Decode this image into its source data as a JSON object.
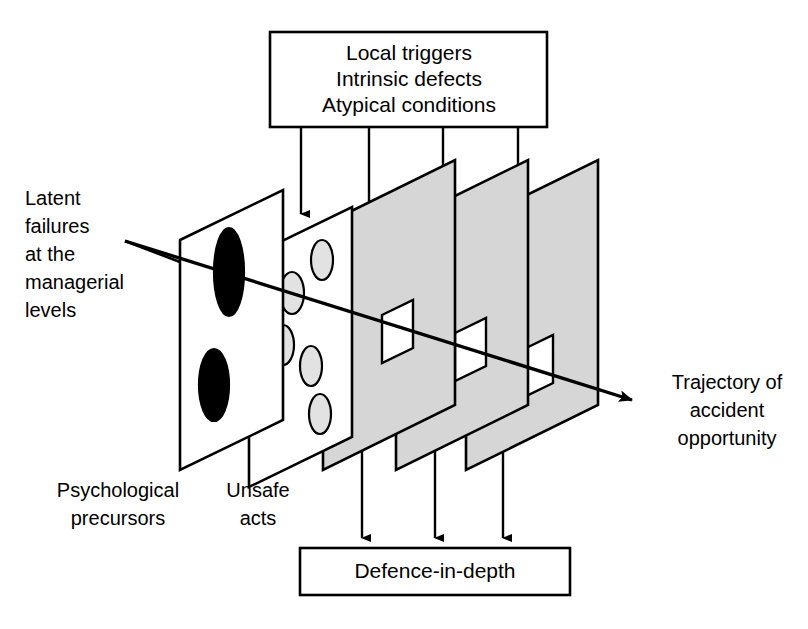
{
  "diagram": {
    "type": "layered-defences-diagram",
    "colors": {
      "stroke": "#000000",
      "background": "#ffffff",
      "plane_gray": "#d6d6d6",
      "hole_dark": "#000000",
      "hole_light": "#e2e2e2",
      "hole_white": "#ffffff"
    },
    "top_box": {
      "lines": [
        "Local triggers",
        "Intrinsic defects",
        "Atypical conditions"
      ],
      "x": 270,
      "y": 32,
      "width": 277,
      "height": 95
    },
    "bottom_box": {
      "label": "Defence-in-depth",
      "x": 300,
      "y": 548,
      "width": 270,
      "height": 47
    },
    "labels": {
      "latent_failures": {
        "lines": [
          "Latent",
          "failures",
          "at the",
          "managerial",
          "levels"
        ],
        "x": 25,
        "y": 200
      },
      "psychological_precursors": {
        "lines": [
          "Psychological",
          "precursors"
        ],
        "x": 118,
        "y": 490
      },
      "unsafe_acts": {
        "lines": [
          "Unsafe",
          "acts"
        ],
        "x": 258,
        "y": 490
      },
      "trajectory": {
        "lines": [
          "Trajectory of",
          "accident",
          "opportunity"
        ],
        "x": 727,
        "y": 382
      }
    },
    "planes": [
      {
        "name": "latent-failures-plane",
        "fill": "#ffffff",
        "points": "180,240 283,190 283,420 180,470",
        "holes": [
          {
            "shape": "ellipse",
            "cx": 229,
            "cy": 272,
            "rx": 15,
            "ry": 44,
            "fill": "#000000"
          },
          {
            "shape": "ellipse",
            "cx": 214,
            "cy": 385,
            "rx": 15,
            "ry": 36,
            "fill": "#000000"
          }
        ]
      },
      {
        "name": "psychological-precursors-plane",
        "fill": "#ffffff",
        "points": "249,257 352,207 352,437 249,487",
        "holes": [
          {
            "shape": "ellipse",
            "cx": 322,
            "cy": 260,
            "rx": 11,
            "ry": 20,
            "fill": "#e2e2e2"
          },
          {
            "shape": "ellipse",
            "cx": 292,
            "cy": 293,
            "rx": 12,
            "ry": 21,
            "fill": "#e2e2e2"
          },
          {
            "shape": "ellipse",
            "cx": 283,
            "cy": 345,
            "rx": 11,
            "ry": 20,
            "fill": "#e2e2e2"
          },
          {
            "shape": "ellipse",
            "cx": 311,
            "cy": 366,
            "rx": 11,
            "ry": 20,
            "fill": "#e2e2e2"
          },
          {
            "shape": "ellipse",
            "cx": 320,
            "cy": 414,
            "rx": 11,
            "ry": 20,
            "fill": "#e2e2e2"
          }
        ]
      },
      {
        "name": "defence-plane-1",
        "fill": "#d6d6d6",
        "points": "323,225 455,160 455,405 323,470",
        "holes": [
          {
            "shape": "window",
            "points": "382,315 413,300 413,348 382,363",
            "fill": "#ffffff"
          }
        ]
      },
      {
        "name": "defence-plane-2",
        "fill": "#d6d6d6",
        "points": "396,225 528,160 528,405 396,470",
        "holes": [
          {
            "shape": "window",
            "points": "455,333 486,318 486,366 455,381",
            "fill": "#ffffff"
          }
        ]
      },
      {
        "name": "defence-plane-3",
        "fill": "#d6d6d6",
        "points": "466,225 598,160 598,405 466,470",
        "holes": [
          {
            "shape": "window",
            "points": "522,350 553,335 553,383 522,398",
            "fill": "#ffffff"
          }
        ]
      }
    ],
    "top_arrows": [
      {
        "name": "top-arrow-1",
        "x": 301,
        "y_start": 127,
        "y_end": 222
      },
      {
        "name": "top-arrow-2",
        "x": 369,
        "y_start": 127,
        "y_end": 232
      },
      {
        "name": "top-arrow-3",
        "x": 443,
        "y_start": 127,
        "y_end": 228
      },
      {
        "name": "top-arrow-4",
        "x": 518,
        "y_start": 127,
        "y_end": 225
      }
    ],
    "bottom_arrows": [
      {
        "name": "bottom-arrow-1",
        "x": 362,
        "y_start": 452,
        "y_end": 546
      },
      {
        "name": "bottom-arrow-2",
        "x": 435,
        "y_start": 452,
        "y_end": 546
      },
      {
        "name": "bottom-arrow-3",
        "x": 503,
        "y_start": 452,
        "y_end": 546
      }
    ],
    "trajectory_arrow": {
      "name": "accident-trajectory-arrow",
      "points": "125,241 645,404",
      "arrowhead_at": [
        645,
        404
      ]
    },
    "latent_pointer": {
      "name": "latent-failures-pointer",
      "points": "125,241 180,262"
    }
  }
}
